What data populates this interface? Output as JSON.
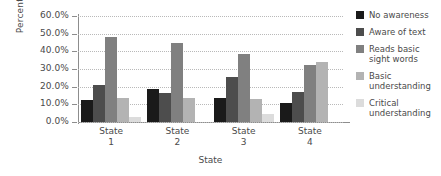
{
  "chart_data": {
    "type": "bar",
    "title": "",
    "xlabel": "State",
    "ylabel": "Percentage",
    "categories": [
      "State 1",
      "State 2",
      "State 3",
      "State 4"
    ],
    "category_lines": [
      [
        "State",
        "1"
      ],
      [
        "State",
        "2"
      ],
      [
        "State",
        "3"
      ],
      [
        "State",
        "4"
      ]
    ],
    "series": [
      {
        "name": "No awareness",
        "color": "#1a1a1a",
        "values": [
          12.5,
          18.5,
          13.5,
          11.0
        ]
      },
      {
        "name": "Aware of text",
        "color": "#4d4d4d",
        "values": [
          21.0,
          16.5,
          25.5,
          17.0
        ]
      },
      {
        "name": "Reads basic sight words",
        "color": "#808080",
        "values": [
          48.0,
          45.0,
          38.5,
          32.0
        ]
      },
      {
        "name": "Basic understanding",
        "color": "#b3b3b3",
        "values": [
          13.5,
          13.5,
          13.0,
          34.0
        ]
      },
      {
        "name": "Critical understanding",
        "color": "#dcdcdc",
        "values": [
          3.0,
          0.0,
          4.5,
          0.0
        ]
      }
    ],
    "ylim": [
      0,
      60
    ],
    "yticks": [
      0,
      10,
      20,
      30,
      40,
      50,
      60
    ],
    "ytick_labels": [
      "0.0%",
      "10.0%",
      "20.0%",
      "30.0%",
      "40.0%",
      "50.0%",
      "60.0%"
    ],
    "grid": true,
    "legend_position": "right",
    "legend_entries": [
      {
        "label_lines": [
          "No awareness"
        ],
        "color": "#1a1a1a"
      },
      {
        "label_lines": [
          "Aware of text"
        ],
        "color": "#4d4d4d"
      },
      {
        "label_lines": [
          "Reads basic",
          "sight words"
        ],
        "color": "#808080"
      },
      {
        "label_lines": [
          "Basic",
          "understanding"
        ],
        "color": "#b3b3b3"
      },
      {
        "label_lines": [
          "Critical",
          "understanding"
        ],
        "color": "#dcdcdc"
      }
    ]
  }
}
